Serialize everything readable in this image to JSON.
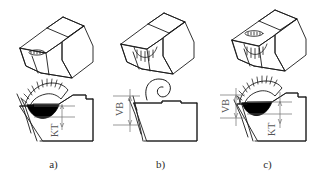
{
  "figure": {
    "line_color": "#1a1a1a",
    "crater_fill_color": "#000000",
    "dimension_color": "#666666",
    "background_color": "#ffffff"
  },
  "panels": [
    {
      "id": "a",
      "caption": "a)",
      "wear_type": "crater wear",
      "iso_view_label": "tool-isometric-crater-wear",
      "section_view_label": "tool-section-crater-wear",
      "dimensions": [
        {
          "symbol": "KT",
          "meaning": "crater depth",
          "orientation": "vertical"
        }
      ]
    },
    {
      "id": "b",
      "caption": "b)",
      "wear_type": "flank wear",
      "iso_view_label": "tool-isometric-flank-wear",
      "section_view_label": "tool-section-flank-wear",
      "dimensions": [
        {
          "symbol": "VB",
          "meaning": "flank wear width",
          "orientation": "vertical"
        }
      ]
    },
    {
      "id": "c",
      "caption": "c)",
      "wear_type": "combined crater and flank wear",
      "iso_view_label": "tool-isometric-combined-wear",
      "section_view_label": "tool-section-combined-wear",
      "dimensions": [
        {
          "symbol": "VB",
          "meaning": "flank wear width",
          "orientation": "vertical"
        },
        {
          "symbol": "KT",
          "meaning": "crater depth",
          "orientation": "vertical"
        }
      ]
    }
  ],
  "labels": {
    "kt": "KT",
    "vb": "VB",
    "caption_a": "a)",
    "caption_b": "b)",
    "caption_c": "c)"
  }
}
